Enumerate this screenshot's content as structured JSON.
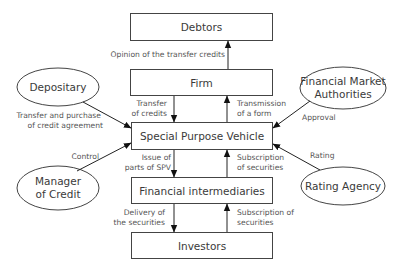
{
  "diagram": {
    "type": "securitization-flow",
    "nodes": {
      "debtors": {
        "label": "Debtors",
        "shape": "rectangle"
      },
      "firm": {
        "label": "Firm",
        "shape": "rectangle"
      },
      "spv": {
        "label": "Special Purpose Vehicle",
        "shape": "rectangle"
      },
      "intermediaries": {
        "label": "Financial intermediaries",
        "shape": "rectangle"
      },
      "investors": {
        "label": "Investors",
        "shape": "rectangle"
      },
      "depositary": {
        "label": "Depositary",
        "shape": "ellipse"
      },
      "fma": {
        "line1": "Financial Market",
        "line2": "Authorities",
        "shape": "ellipse"
      },
      "manager": {
        "line1": "Manager",
        "line2": "of Credit",
        "shape": "ellipse"
      },
      "rating": {
        "label": "Rating Agency",
        "shape": "ellipse"
      }
    },
    "edges": {
      "firm_to_debtors": {
        "from": "Firm",
        "to": "Debtors",
        "label": "Opinion of the transfer credits"
      },
      "firm_to_spv": {
        "from": "Firm",
        "to": "Special Purpose Vehicle",
        "line1": "Transfer",
        "line2": "of credits"
      },
      "spv_to_firm": {
        "from": "Special Purpose Vehicle",
        "to": "Firm",
        "line1": "Transmission",
        "line2": "of a form"
      },
      "spv_to_intermediaries": {
        "from": "Special Purpose Vehicle",
        "to": "Financial intermediaries",
        "line1": "Issue of",
        "line2": "parts of SPV"
      },
      "intermediaries_to_spv": {
        "from": "Financial intermediaries",
        "to": "Special Purpose Vehicle",
        "line1": "Subscription",
        "line2": "of securities"
      },
      "intermediaries_to_investors": {
        "from": "Financial intermediaries",
        "to": "Investors",
        "line1": "Delivery of",
        "line2": "the securities"
      },
      "investors_to_intermediaries": {
        "from": "Investors",
        "to": "Financial intermediaries",
        "line1": "Subscription of",
        "line2": "securities"
      },
      "depositary_to_spv": {
        "from": "Depositary",
        "to": "Special Purpose Vehicle",
        "line1": "Transfer and purchase",
        "line2": "of credit agreement"
      },
      "fma_to_spv": {
        "from": "Financial Market Authorities",
        "to": "Special Purpose Vehicle",
        "label": "Approval"
      },
      "manager_to_spv": {
        "from": "Manager of Credit",
        "to": "Special Purpose Vehicle",
        "label": "Control"
      },
      "rating_to_spv": {
        "from": "Rating Agency",
        "to": "Special Purpose Vehicle",
        "label": "Rating"
      }
    }
  }
}
